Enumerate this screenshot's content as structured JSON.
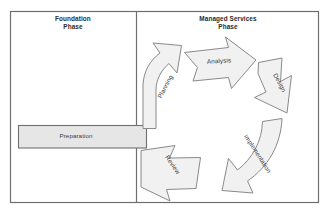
{
  "diagram": {
    "title_left": "Foundation\nPhase",
    "title_right": "Managed Services\nPhase",
    "colors": {
      "border": "#6f6f6f",
      "divider": "#6f6f6f",
      "shape_fill": "#f1f1f1",
      "shape_stroke": "#8a8a8a",
      "bar_fill": "#e6e6e6",
      "bar_stroke": "#6f6f6f",
      "text": "#3a3a3a",
      "background": "#ffffff"
    },
    "left_panel": {
      "label": "Foundation Phase",
      "bar": {
        "label": "Preparation"
      }
    },
    "right_panel": {
      "label": "Managed Services Phase",
      "cycle": {
        "direction": "clockwise",
        "steps": [
          {
            "label": "Planning"
          },
          {
            "label": "Analysis"
          },
          {
            "label": "Design"
          },
          {
            "label": "Implementation"
          },
          {
            "label": "Review"
          }
        ]
      }
    }
  }
}
